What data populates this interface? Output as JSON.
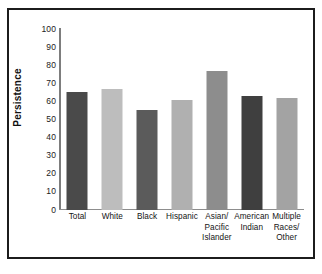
{
  "chart_data": {
    "type": "bar",
    "title": "",
    "subtitle": "",
    "xlabel": "",
    "ylabel": "Persistence",
    "ylim": [
      0,
      100
    ],
    "ytick_step": 10,
    "yticks": [
      "100",
      "90",
      "80",
      "70",
      "60",
      "50",
      "40",
      "30",
      "20",
      "10",
      "0"
    ],
    "grid": false,
    "legend": null,
    "categories": [
      "Total",
      "White",
      "Black",
      "Hispanic",
      "Asian/ Pacific Islander",
      "American Indian",
      "Multiple Races/ Other"
    ],
    "category_lines": [
      [
        "Total"
      ],
      [
        "White"
      ],
      [
        "Black"
      ],
      [
        "Hispanic"
      ],
      [
        "Asian/",
        "Pacific",
        "Islander"
      ],
      [
        "American",
        "Indian"
      ],
      [
        "Multiple",
        "Races/",
        "Other"
      ]
    ],
    "values": [
      65,
      67,
      55,
      61,
      77,
      63,
      62
    ],
    "bar_colors": [
      "#4a4a4a",
      "#bdbdbd",
      "#5b5b5b",
      "#b0b0b0",
      "#8d8d8d",
      "#3f3f3f",
      "#a3a3a3"
    ]
  },
  "axes": {
    "y_axis_color": "#7d7d7d",
    "x_axis_color": "#8d8d8d"
  },
  "frame": {
    "border_color": "#1c1c1c",
    "background": "#ffffff"
  }
}
